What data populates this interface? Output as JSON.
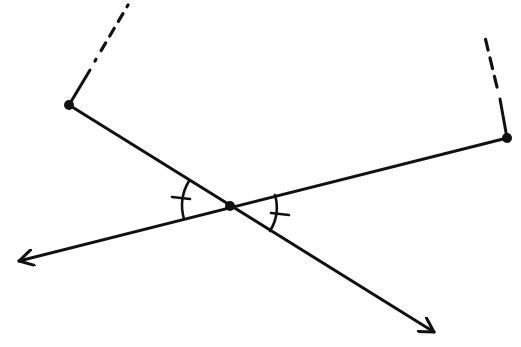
{
  "diagram": {
    "type": "geometry-vertical-angles",
    "width": 521,
    "height": 347,
    "stroke_color": "#111111",
    "background": "#ffffff",
    "points": {
      "left_vertex": {
        "x": 69,
        "y": 105
      },
      "center": {
        "x": 230,
        "y": 206
      },
      "right_vertex": {
        "x": 507,
        "y": 138
      },
      "left_arrow_tip": {
        "x": 17,
        "y": 262
      },
      "bottom_right_arrow_tip": {
        "x": 436,
        "y": 333
      }
    },
    "lines": [
      {
        "name": "line-left-vertex-to-arrow",
        "from": "left_vertex",
        "to": "bottom_right_arrow_tip",
        "style": "solid",
        "arrow_end": true
      },
      {
        "name": "line-right-vertex-to-arrow",
        "from": "right_vertex",
        "to": "left_arrow_tip",
        "style": "solid",
        "arrow_end": true
      }
    ],
    "partial_segments": [
      {
        "name": "left-vertex-upper-solid",
        "x1": 69,
        "y1": 105,
        "x2": 89,
        "y2": 71,
        "style": "solid"
      },
      {
        "name": "left-vertex-upper-dashed",
        "x1": 89,
        "y1": 71,
        "x2": 128,
        "y2": 5,
        "style": "dash-dot"
      },
      {
        "name": "right-vertex-upper-solid",
        "x1": 507,
        "y1": 138,
        "x2": 500,
        "y2": 100,
        "style": "solid"
      },
      {
        "name": "right-vertex-upper-dashed",
        "x1": 500,
        "y1": 100,
        "x2": 485,
        "y2": 33,
        "style": "dashed"
      }
    ],
    "angle_marks": [
      {
        "name": "left-angle-arc",
        "center": "center",
        "radius": 50,
        "tick_count": 1
      },
      {
        "name": "right-angle-arc",
        "center": "center",
        "radius": 45,
        "tick_count": 1
      }
    ],
    "labels": []
  }
}
